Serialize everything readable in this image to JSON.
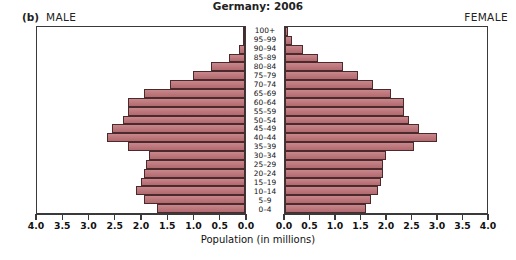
{
  "figure": {
    "panel_label": "(b)",
    "male_label": "MALE",
    "female_label": "FEMALE"
  },
  "colors": {
    "bar_fill": "#bd7075",
    "bar_stroke": "#4a2a2c",
    "axis": "#3a3a3a",
    "background": "#ffffff",
    "text": "#111111"
  },
  "chart_data": {
    "type": "bar",
    "subtype": "population-pyramid",
    "title": "Germany: 2006",
    "xlabel": "Population (in millions)",
    "ylabel": "",
    "xlim": [
      0,
      4.0
    ],
    "left_axis_ticks": [
      "4.0",
      "3.5",
      "3.0",
      "2.5",
      "2.0",
      "1.5",
      "1.0",
      "0.5",
      "0.0"
    ],
    "right_axis_ticks": [
      "0.0",
      "0.5",
      "1.0",
      "1.5",
      "2.0",
      "2.5",
      "3.0",
      "3.5",
      "4.0"
    ],
    "tick_values": [
      4.0,
      3.5,
      3.0,
      2.5,
      2.0,
      1.5,
      1.0,
      0.5,
      0.0
    ],
    "grid": false,
    "legend": false,
    "axis_unit": "millions",
    "categories": [
      "100+",
      "95–99",
      "90–94",
      "85–89",
      "80–84",
      "75–79",
      "70–74",
      "65–69",
      "60–64",
      "55–59",
      "50–54",
      "45–49",
      "40–44",
      "35–39",
      "30–34",
      "25–29",
      "20–24",
      "15–19",
      "10–14",
      "5–9",
      "0–4"
    ],
    "series": [
      {
        "name": "MALE",
        "side": "left",
        "values": [
          0.01,
          0.04,
          0.12,
          0.3,
          0.65,
          1.0,
          1.45,
          1.95,
          2.25,
          2.25,
          2.35,
          2.55,
          2.65,
          2.25,
          1.85,
          1.9,
          1.95,
          2.0,
          2.1,
          1.95,
          1.7
        ]
      },
      {
        "name": "FEMALE",
        "side": "right",
        "values": [
          0.05,
          0.14,
          0.35,
          0.65,
          1.15,
          1.45,
          1.75,
          2.1,
          2.35,
          2.35,
          2.45,
          2.65,
          3.0,
          2.55,
          2.0,
          1.95,
          1.95,
          1.9,
          1.85,
          1.7,
          1.6
        ]
      }
    ]
  }
}
